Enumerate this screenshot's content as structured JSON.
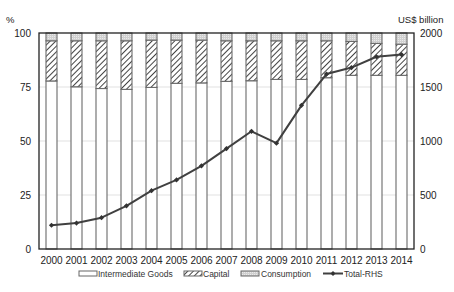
{
  "chart_data": {
    "type": "bar",
    "subtype": "stacked-bar-with-line",
    "title": "",
    "categories": [
      "2000",
      "2001",
      "2002",
      "2003",
      "2004",
      "2005",
      "2006",
      "2007",
      "2008",
      "2009",
      "2010",
      "2011",
      "2012",
      "2013",
      "2014"
    ],
    "left_axis": {
      "label": "%",
      "ylim": [
        0,
        100
      ],
      "ticks": [
        0,
        25,
        50,
        75,
        100
      ]
    },
    "right_axis": {
      "label": "US$ billion",
      "ylim": [
        0,
        2000
      ],
      "ticks": [
        0,
        500,
        1000,
        1500,
        2000
      ]
    },
    "grid": true,
    "legend_position": "bottom",
    "series": [
      {
        "name": "Intermediate Goods",
        "axis": "left",
        "kind": "bar",
        "pattern": "white",
        "values": [
          77.8,
          75.1,
          74.3,
          73.9,
          74.8,
          76.7,
          76.9,
          77.6,
          77.9,
          78.5,
          78.5,
          79.3,
          80.4,
          80.4,
          80.4
        ]
      },
      {
        "name": "Capital",
        "axis": "left",
        "kind": "bar",
        "pattern": "hatch",
        "values": [
          18.6,
          21.3,
          22.1,
          22.5,
          21.9,
          20.0,
          19.8,
          18.8,
          18.5,
          17.9,
          17.9,
          17.1,
          15.7,
          14.8,
          14.4
        ]
      },
      {
        "name": "Consumption",
        "axis": "left",
        "kind": "bar",
        "pattern": "dotted-grey",
        "values": [
          3.6,
          3.6,
          3.6,
          3.6,
          3.3,
          3.3,
          3.3,
          3.6,
          3.6,
          3.6,
          3.6,
          3.6,
          3.9,
          4.8,
          5.2
        ]
      },
      {
        "name": "Total-RHS",
        "axis": "right",
        "kind": "line",
        "values": [
          220,
          240,
          290,
          400,
          540,
          640,
          770,
          930,
          1090,
          980,
          1330,
          1620,
          1680,
          1780,
          1800
        ]
      }
    ]
  },
  "labels": {
    "left_unit": "%",
    "right_unit": "US$ billion",
    "left_ticks": [
      "0",
      "25",
      "50",
      "75",
      "100"
    ],
    "right_ticks": [
      "0",
      "500",
      "1000",
      "1500",
      "2000"
    ],
    "legend": {
      "intermediate": "Intermediate Goods",
      "capital": "Capital",
      "consumption": "Consumption",
      "total": "Total-RHS"
    }
  },
  "colors": {
    "bar_stroke": "#6a6a6a",
    "consumption_fill": "#d4d4d4",
    "hatch_stroke": "#444444",
    "line": "#404040",
    "grid": "#e2e2e2",
    "frame": "#222222"
  }
}
